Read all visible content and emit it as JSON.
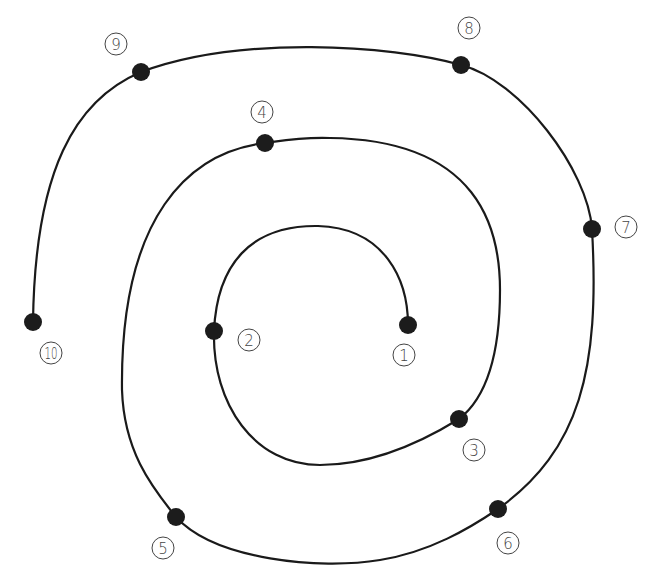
{
  "diagram": {
    "type": "numbered-spiral-path",
    "colors": {
      "line": "#1a1a1a",
      "dot": "#1c1c1c",
      "label": "#444444",
      "background": "#ffffff"
    },
    "points": [
      {
        "id": 1,
        "label": "1",
        "x": 408,
        "y": 325,
        "label_x": 404,
        "label_y": 355
      },
      {
        "id": 2,
        "label": "2",
        "x": 214,
        "y": 331,
        "label_x": 249,
        "label_y": 340
      },
      {
        "id": 3,
        "label": "3",
        "x": 459,
        "y": 419,
        "label_x": 474,
        "label_y": 450
      },
      {
        "id": 4,
        "label": "4",
        "x": 265,
        "y": 143,
        "label_x": 262,
        "label_y": 112
      },
      {
        "id": 5,
        "label": "5",
        "x": 176,
        "y": 517,
        "label_x": 163,
        "label_y": 548
      },
      {
        "id": 6,
        "label": "6",
        "x": 498,
        "y": 509,
        "label_x": 508,
        "label_y": 543
      },
      {
        "id": 7,
        "label": "7",
        "x": 592,
        "y": 229,
        "label_x": 626,
        "label_y": 227
      },
      {
        "id": 8,
        "label": "8",
        "x": 461,
        "y": 65,
        "label_x": 469,
        "label_y": 28
      },
      {
        "id": 9,
        "label": "9",
        "x": 141,
        "y": 72,
        "label_x": 116,
        "label_y": 44
      },
      {
        "id": 10,
        "label": "10",
        "x": 33,
        "y": 322,
        "label_x": 51,
        "label_y": 353
      }
    ],
    "path_d": "M 408 325 C 408 280, 385 228, 318 226 C 250 225, 217 265, 214 331 C 212 405, 255 465, 320 465 C 375 465, 425 440, 459 419 C 490 395, 500 345, 500 290 C 500 230, 480 140, 330 138 C 300 137, 280 141, 265 143 C 190 152, 120 215, 122 390 C 124 450, 150 485, 176 517 C 215 560, 320 570, 380 560 C 430 552, 470 528, 498 509 C 580 450, 600 370, 592 229 C 588 170, 520 80, 461 65 C 390 45, 240 35, 141 72 C 75 100, 35 170, 33 322"
  }
}
